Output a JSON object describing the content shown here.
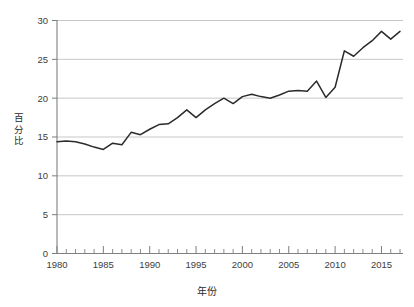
{
  "chart_data": {
    "type": "line",
    "title": "",
    "subtitle": "",
    "xlabel": "年份",
    "ylabel": "百分比",
    "xlim": [
      1980,
      2017
    ],
    "ylim": [
      0,
      30
    ],
    "grid": "horizontal",
    "legend": "none",
    "y_ticks": [
      0,
      5,
      10,
      15,
      20,
      25,
      30
    ],
    "y_tick_labels": [
      "0",
      "5",
      "10",
      "15",
      "20",
      "25",
      "30"
    ],
    "x_ticks": [
      1980,
      1985,
      1990,
      1995,
      2000,
      2005,
      2010,
      2015
    ],
    "x_tick_labels": [
      "1980",
      "1985",
      "1990",
      "1995",
      "2000",
      "2005",
      "2010",
      "2015"
    ],
    "x_minor_tick_interval": 1,
    "series": [
      {
        "name": "百分比",
        "color": "#2b2b2b",
        "x": [
          1980,
          1981,
          1982,
          1983,
          1984,
          1985,
          1986,
          1987,
          1988,
          1989,
          1990,
          1991,
          1992,
          1993,
          1994,
          1995,
          1996,
          1997,
          1998,
          1999,
          2000,
          2001,
          2002,
          2003,
          2004,
          2005,
          2006,
          2007,
          2008,
          2009,
          2010,
          2011,
          2012,
          2013,
          2014,
          2015,
          2016,
          2017
        ],
        "values": [
          14.4,
          14.5,
          14.4,
          14.1,
          13.7,
          13.4,
          14.2,
          14.0,
          15.6,
          15.3,
          16.0,
          16.6,
          16.7,
          17.5,
          18.5,
          17.5,
          18.5,
          19.3,
          20.0,
          19.3,
          20.2,
          20.5,
          20.2,
          20.0,
          20.4,
          20.9,
          21.0,
          20.9,
          22.2,
          20.1,
          21.4,
          26.1,
          25.4,
          26.5,
          27.4,
          28.6,
          27.6,
          28.6
        ]
      }
    ]
  },
  "axis": {
    "ylabel_chars": [
      "百",
      "分",
      "比"
    ],
    "xlabel_text": "年份"
  }
}
